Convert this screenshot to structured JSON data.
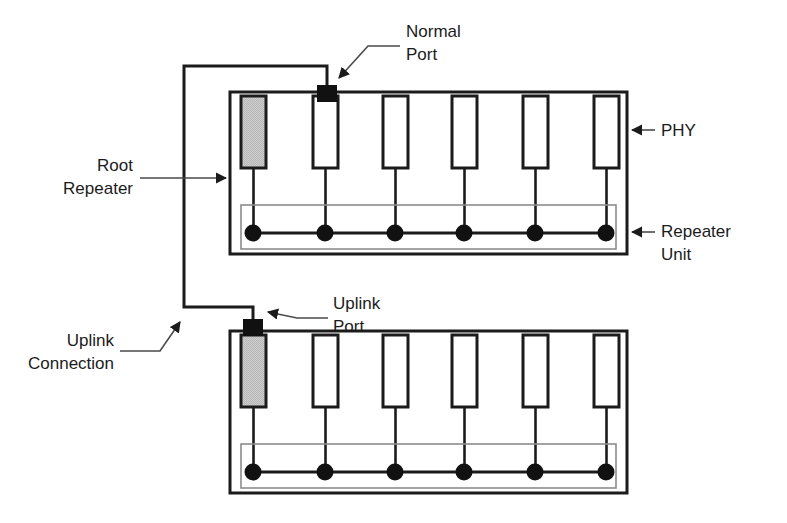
{
  "figure": {
    "kind": "network-topology-diagram",
    "background_color": "#ffffff",
    "line_color": "#1b1b1b",
    "phy_fill": "#ffffff",
    "uplink_phy_fill": "#c9c9c9",
    "port_color": "#111111",
    "repeater_unit_outline": "#8c8c8c"
  },
  "labels": {
    "normal_port": "Normal\nPort",
    "uplink_port": "Uplink\nPort",
    "phy": "PHY",
    "repeater_unit": "Repeater\nUnit",
    "root_repeater": "Root\nRepeater",
    "uplink_connection": "Uplink\nConnection"
  },
  "repeaters": [
    {
      "id": "root-repeater",
      "role": "root",
      "phy_count": 6,
      "uplink_phy_index": 0,
      "uplink_phy_shaded": true,
      "port_marker": {
        "type": "normal-port",
        "phy_index": 1,
        "x": 327,
        "y": 93
      },
      "box": {
        "x": 230,
        "y": 92,
        "w": 397,
        "h": 162
      },
      "phy_tops_y": 96,
      "phy_bottom_y": 168,
      "bus_y": 233,
      "unit_box": {
        "x": 241,
        "y": 205,
        "w": 375,
        "h": 44
      },
      "phy_x_centers": [
        253,
        324,
        395,
        464,
        535,
        606
      ]
    },
    {
      "id": "downstream-repeater",
      "role": "downstream",
      "phy_count": 6,
      "uplink_phy_index": 0,
      "uplink_phy_shaded": true,
      "port_marker": {
        "type": "uplink-port",
        "phy_index": 0,
        "x": 253,
        "y": 327
      },
      "box": {
        "x": 230,
        "y": 331,
        "w": 397,
        "h": 162
      },
      "phy_tops_y": 335,
      "phy_bottom_y": 407,
      "bus_y": 472,
      "unit_box": {
        "x": 241,
        "y": 444,
        "w": 375,
        "h": 44
      },
      "phy_x_centers": [
        253,
        324,
        395,
        464,
        535,
        606
      ]
    }
  ],
  "uplink_wire": {
    "description": "Normal port of root repeater routed left and down to uplink port of downstream repeater",
    "points": [
      [
        327,
        93
      ],
      [
        327,
        66
      ],
      [
        184,
        66
      ],
      [
        184,
        307
      ],
      [
        253,
        307
      ],
      [
        253,
        327
      ]
    ]
  },
  "callouts": [
    {
      "name": "normal-port",
      "target": [
        336,
        85
      ],
      "text_at": [
        407,
        25
      ],
      "align": "left"
    },
    {
      "name": "uplink-port",
      "target": [
        262,
        320
      ],
      "text_at": [
        335,
        297
      ],
      "align": "left"
    },
    {
      "name": "phy",
      "target": [
        627,
        130
      ],
      "text_at": [
        660,
        121
      ],
      "align": "left"
    },
    {
      "name": "repeater-unit",
      "target": [
        627,
        232
      ],
      "text_at": [
        660,
        223
      ],
      "align": "left"
    },
    {
      "name": "root-repeater",
      "target": [
        228,
        178
      ],
      "text_at": [
        100,
        155
      ],
      "align": "right"
    },
    {
      "name": "uplink-connection",
      "target": [
        184,
        318
      ],
      "text_at": [
        145,
        343
      ],
      "align": "right"
    }
  ]
}
